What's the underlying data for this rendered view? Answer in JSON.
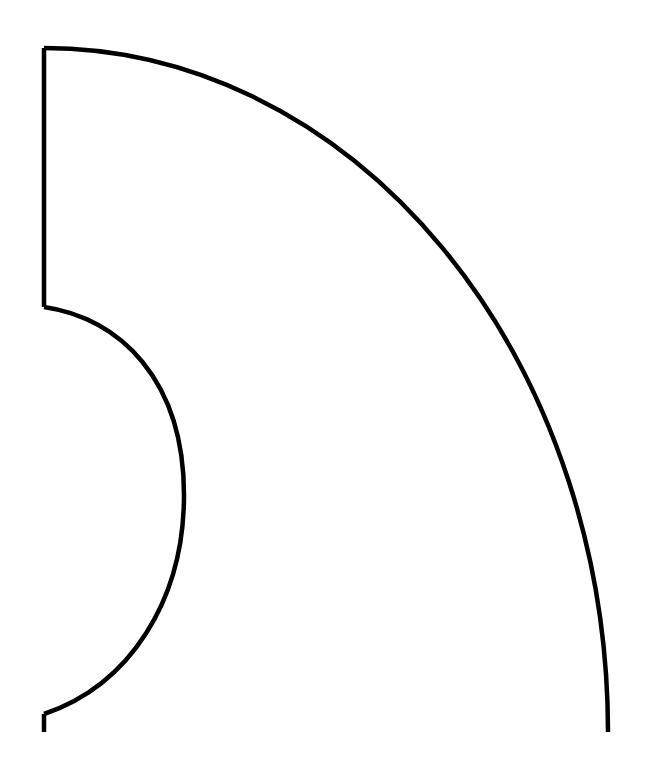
{
  "diagram": {
    "title": "",
    "background": "#ffffff",
    "stroke_color": "#000000",
    "stroke_width": 4.5,
    "shape": {
      "description": "Quarter-ellipse annular sector outline with a semicircular notch on the left edge",
      "outer_arc": {
        "start": [
          44,
          48
        ],
        "end": [
          608,
          732
        ],
        "rx": 564,
        "ry": 684
      },
      "left_edge_top": {
        "from": [
          44,
          48
        ],
        "to": [
          44,
          307
        ]
      },
      "inner_notch": {
        "start": [
          44,
          307
        ],
        "apex": [
          183,
          497
        ],
        "end": [
          44,
          714
        ]
      },
      "left_edge_bottom": {
        "from": [
          44,
          714
        ],
        "to": [
          44,
          732
        ]
      }
    }
  }
}
